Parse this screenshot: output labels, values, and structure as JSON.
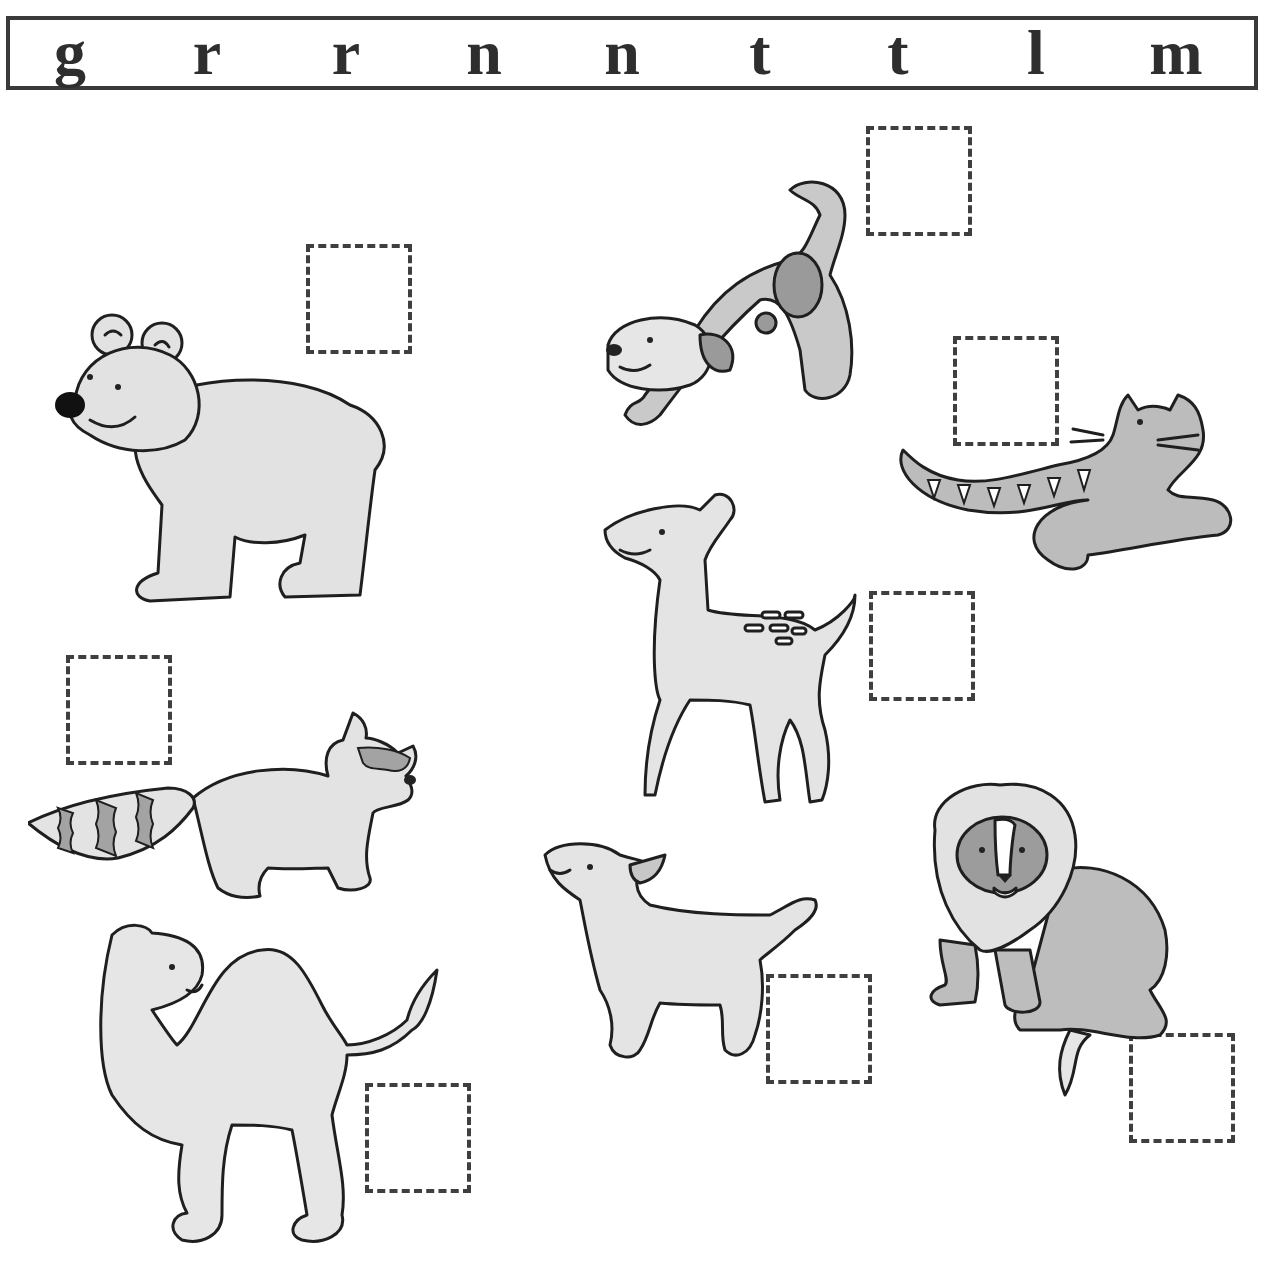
{
  "worksheet": {
    "letter_bank": [
      "g",
      "r",
      "r",
      "n",
      "n",
      "t",
      "t",
      "l",
      "m"
    ],
    "colors": {
      "border": "#3a3a3a",
      "text": "#2e2e2e",
      "fill_light": "#e4e4e4",
      "fill_mid": "#bdbdbd",
      "fill_dark": "#8f8f8f"
    },
    "animals": [
      {
        "name": "bear",
        "answer_value": ""
      },
      {
        "name": "puppy",
        "answer_value": ""
      },
      {
        "name": "tiger",
        "answer_value": ""
      },
      {
        "name": "fawn",
        "answer_value": ""
      },
      {
        "name": "raccoon",
        "answer_value": ""
      },
      {
        "name": "camel",
        "answer_value": ""
      },
      {
        "name": "lamb",
        "answer_value": ""
      },
      {
        "name": "lion",
        "answer_value": ""
      }
    ]
  }
}
